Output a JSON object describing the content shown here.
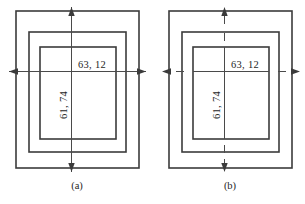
{
  "figure": {
    "dimension_labels": {
      "horizontal": "63, 12",
      "vertical": "61, 74"
    },
    "colors": {
      "rect_stroke": "#3b3b3b",
      "dimension_stroke": "#4a4a4a",
      "text": "#262626",
      "background": "#ffffff"
    },
    "panels": [
      {
        "caption": "(a)",
        "line_style": "solid",
        "horizontal_value": "63, 12",
        "vertical_value": "61, 74"
      },
      {
        "caption": "(b)",
        "line_style": "dashed-centerline",
        "horizontal_value": "63, 12",
        "vertical_value": "61, 74"
      }
    ]
  }
}
